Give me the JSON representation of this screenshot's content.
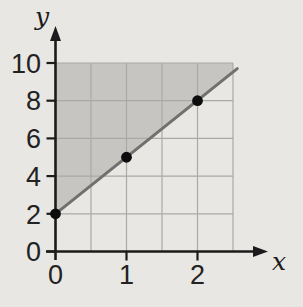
{
  "page": {
    "background": "#e8e7e3"
  },
  "chart_data": {
    "type": "line",
    "title": "",
    "xlabel": "x",
    "ylabel": "y",
    "xlim": [
      0,
      2.5
    ],
    "ylim": [
      0,
      10
    ],
    "x_ticks": [
      0,
      1,
      2
    ],
    "y_ticks": [
      0,
      2,
      4,
      6,
      8,
      10
    ],
    "x_grid_step": 0.5,
    "y_grid_step": 2,
    "grid": true,
    "legend": false,
    "series": [
      {
        "name": "plotted-line",
        "x": [
          0,
          1,
          2
        ],
        "y": [
          2,
          5,
          8
        ],
        "marker": "filled-dot"
      }
    ],
    "line_segment": {
      "from": [
        0,
        2
      ],
      "to": [
        2.56,
        9.7
      ]
    },
    "shaded_region": {
      "description": "region above the line and at-or-below y = 10, from x = 0 to x = 2.5",
      "polygon": [
        [
          0,
          2
        ],
        [
          0,
          10
        ],
        [
          2.5,
          10
        ],
        [
          2.5,
          9.5
        ]
      ]
    },
    "colors": {
      "background": "#e8e7e3",
      "shade": "#c6c5c2",
      "grid": "#a9a9a6",
      "line": "#707070",
      "axis": "#1b1b1b",
      "point": "#0d0d0d",
      "text": "#222222"
    }
  }
}
